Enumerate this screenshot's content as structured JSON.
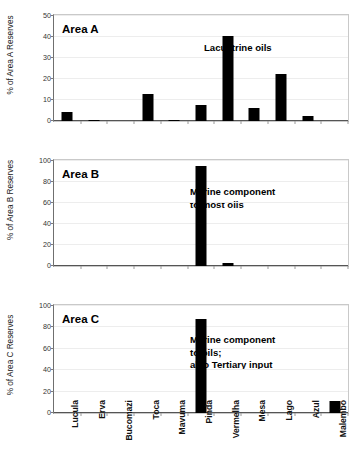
{
  "chart_data": {
    "type": "bar",
    "title": "",
    "subtitle": "",
    "xlabel": "",
    "grid": true,
    "legend": "none",
    "orientation": "vertical",
    "bar_color": "#000000",
    "categories": [
      "Lucula",
      "Erva",
      "Bucomazi",
      "Toca",
      "Mavuma",
      "Pinda",
      "Vermelha",
      "Mesa",
      "Lago",
      "Azul",
      "Malembo"
    ],
    "panels": [
      {
        "key": "area_a",
        "panel_label": "Area A",
        "ylabel": "% of Area A Reserves",
        "ylim": [
          0,
          50
        ],
        "yticks": [
          0,
          10,
          20,
          30,
          40,
          50
        ],
        "ytick_labels": [
          "0",
          "10",
          "20",
          "30",
          "40",
          "50"
        ],
        "annotation": "Lacustrine oils",
        "values": [
          4.4,
          0.4,
          0,
          13.0,
          0.4,
          7.8,
          40.5,
          6.4,
          22.3,
          2.2,
          0
        ]
      },
      {
        "key": "area_b",
        "panel_label": "Area B",
        "ylabel": "% of Area B Reserves",
        "ylim": [
          0,
          100
        ],
        "yticks": [
          0,
          20,
          40,
          60,
          80,
          100
        ],
        "ytick_labels": [
          "0",
          "20",
          "40",
          "60",
          "80",
          "100"
        ],
        "annotation": "Marine component\nto most oils",
        "values": [
          0,
          0,
          0,
          0,
          0,
          95.5,
          3.3,
          0,
          0,
          0,
          0
        ]
      },
      {
        "key": "area_c",
        "panel_label": "Area C",
        "ylabel": "% of Area C Reserves",
        "ylim": [
          0,
          100
        ],
        "yticks": [
          0,
          20,
          40,
          60,
          80,
          100
        ],
        "ytick_labels": [
          "0",
          "20",
          "40",
          "60",
          "80",
          "100"
        ],
        "annotation": "Marine component\nto oils;\nalso Tertiary input",
        "values": [
          0,
          0,
          0,
          0,
          0,
          87.5,
          0,
          0,
          0,
          0,
          11.5
        ]
      }
    ]
  }
}
